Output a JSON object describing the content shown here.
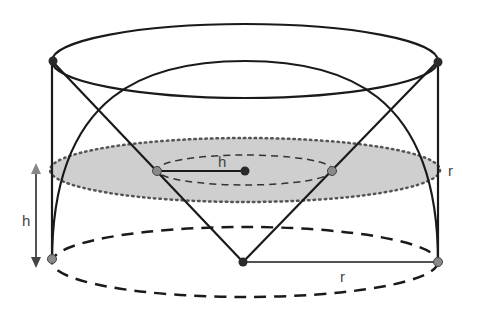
{
  "diagram": {
    "labels": {
      "h_left": "h",
      "h_center": "h",
      "r_right": "r",
      "r_bottom": "r"
    },
    "colors": {
      "stroke": "#1a1a1a",
      "section_fill": "#cfcfcf",
      "point_gray": "#8a8a8a",
      "point_dark": "#2a2a2a",
      "arrow": "#555555"
    }
  }
}
